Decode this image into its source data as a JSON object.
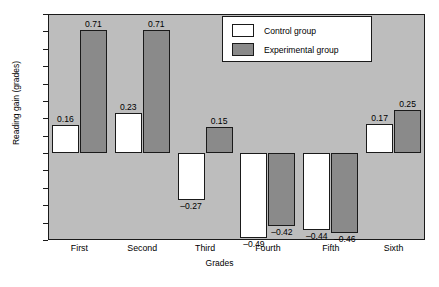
{
  "chart_data": {
    "type": "bar",
    "title": "",
    "xlabel": "Grades",
    "ylabel": "Reading gain (grades)",
    "categories": [
      "First",
      "Second",
      "Third",
      "Fourth",
      "Fifth",
      "Sixth"
    ],
    "series": [
      {
        "name": "Control group",
        "color": "#ffffff",
        "values": [
          0.16,
          0.23,
          -0.27,
          -0.49,
          -0.44,
          0.17
        ],
        "labels": [
          "0.16",
          "0.23",
          "-0.27",
          "-0.49",
          "-0.44",
          "0.17"
        ]
      },
      {
        "name": "Experimental group",
        "color": "#8a8a8a",
        "values": [
          0.71,
          0.71,
          0.15,
          -0.42,
          -0.46,
          0.25
        ],
        "labels": [
          "0.71",
          "0.71",
          "0.15",
          "-0.42",
          "-0.46",
          "0.25"
        ]
      }
    ],
    "ylim": [
      -0.5,
      0.8
    ],
    "yticks": [
      0.8,
      0.7,
      0.6,
      0.5,
      0.4,
      0.3,
      0.2,
      0.1,
      0.0,
      -0.1,
      -0.2,
      -0.3,
      -0.4,
      -0.5
    ],
    "ytick_labels": [
      "0.8",
      "0.7",
      "0.6",
      "0.5",
      "0.4",
      "0.3",
      "0.2",
      "0.1",
      "0.0",
      "-0.1",
      "-0.2",
      "-0.3",
      "-0.4",
      "-0.5"
    ],
    "grid": false,
    "legend_position": "top-center",
    "plot_background": "#bdbdbd",
    "axis_color": "#1a1a1a"
  },
  "legend": {
    "entries": [
      {
        "label": "Control group"
      },
      {
        "label": "Experimental group"
      }
    ]
  }
}
